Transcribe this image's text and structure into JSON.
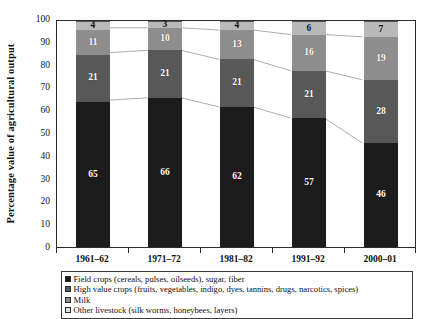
{
  "chart_data": {
    "type": "bar",
    "subtype": "stacked-percentage",
    "title": "",
    "xlabel": "",
    "ylabel": "Percentage value of agricultural output",
    "ylim": [
      0,
      100
    ],
    "ytick_step": 10,
    "yticks": [
      0,
      10,
      20,
      30,
      40,
      50,
      60,
      70,
      80,
      90,
      100
    ],
    "grid": false,
    "legend_position": "bottom",
    "connectors": true,
    "categories": [
      "1961–62",
      "1971–72",
      "1981–82",
      "1991–92",
      "2000–01"
    ],
    "series": [
      {
        "name": "Field crops (cereals, pulses, oilseeds), sugar, fiber",
        "color": "#1c1c1c",
        "values": [
          65,
          66,
          62,
          57,
          46
        ]
      },
      {
        "name": "Milk",
        "color": "#585858",
        "values": [
          21,
          21,
          21,
          21,
          28
        ]
      },
      {
        "name": "High value crops (fruits, vegetables, indigo, dyes, tannins, drugs, narcotics, spices)",
        "color": "#8e8e8e",
        "values": [
          11,
          10,
          13,
          16,
          19
        ]
      },
      {
        "name": "Other livestock (silk worms, honeybees, layers)",
        "color": "#b9b9b9",
        "values": [
          4,
          3,
          4,
          6,
          7
        ]
      }
    ]
  },
  "legend": {
    "items": [
      {
        "label": "Field crops (cereals, pulses, oilseeds), sugar, fiber",
        "swatch": "legend-swatch-field-crops"
      },
      {
        "label": "High value crops (fruits, vegetables, indigo, dyes, tannins, drugs, narcotics, spices)",
        "swatch": "legend-swatch-high-value-crops"
      },
      {
        "label": "Milk",
        "swatch": "legend-swatch-milk"
      },
      {
        "label": "Other livestock (silk worms, honeybees, layers)",
        "swatch": "legend-swatch-other-livestock"
      }
    ]
  }
}
